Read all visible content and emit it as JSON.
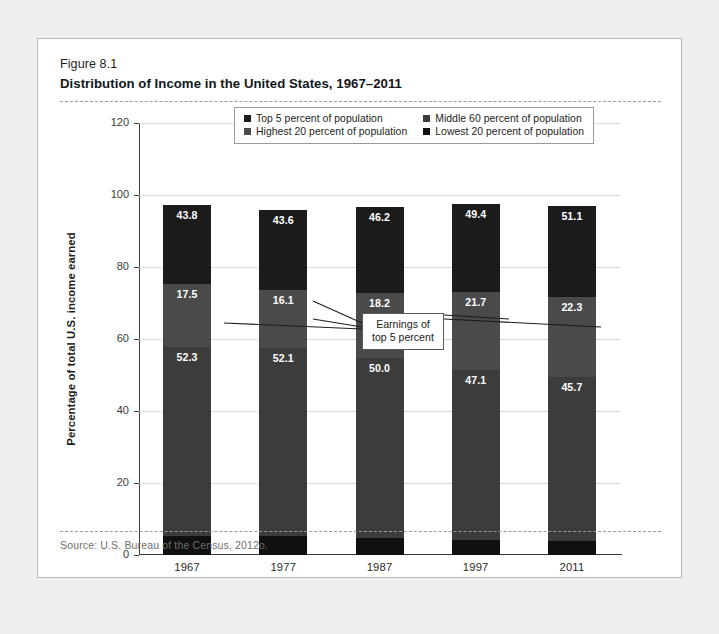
{
  "figure": {
    "number": "Figure 8.1",
    "title": "Distribution of Income in the United States, 1967–2011",
    "source": "Source: U.S. Bureau of the Census, 2012o."
  },
  "callout": {
    "line1": "Earnings of",
    "line2": "top 5 percent"
  },
  "legend": {
    "items": [
      {
        "label": "Top 5 percent of population",
        "color": "#1b1b1b"
      },
      {
        "label": "Middle 60 percent of population",
        "color": "#3c3c3c"
      },
      {
        "label": "Highest 20 percent of population",
        "color": "#4a4a4a"
      },
      {
        "label": "Lowest 20 percent of population",
        "color": "#101010"
      }
    ]
  },
  "chart_data": {
    "type": "bar",
    "title": "Distribution of Income in the United States, 1967–2011",
    "xlabel": "",
    "ylabel": "Percentage of total U.S. income earned",
    "ylim": [
      0,
      120
    ],
    "yticks": [
      0,
      20,
      40,
      60,
      80,
      100,
      120
    ],
    "ytick_labels": [
      "0",
      "20",
      "40",
      "60",
      "80",
      "100",
      "120"
    ],
    "grid": true,
    "stacked": true,
    "legend_position": "top-center",
    "categories": [
      "1967",
      "1977",
      "1987",
      "1997",
      "2011"
    ],
    "series": [
      {
        "name": "Lowest 20 percent of population",
        "color": "#101010",
        "values": [
          5.4,
          5.4,
          4.6,
          4.2,
          3.8
        ],
        "labels": [
          "",
          "",
          "",
          "",
          ""
        ]
      },
      {
        "name": "Middle 60 percent of population",
        "color": "#3c3c3c",
        "values": [
          52.3,
          52.1,
          50.0,
          47.1,
          45.7
        ],
        "labels": [
          "52.3",
          "52.1",
          "50.0",
          "47.1",
          "45.7"
        ]
      },
      {
        "name": "Highest 20 percent of population",
        "color": "#4a4a4a",
        "values": [
          17.5,
          16.1,
          18.2,
          21.7,
          22.3
        ],
        "labels": [
          "17.5",
          "16.1",
          "18.2",
          "21.7",
          "22.3"
        ]
      },
      {
        "name": "Top 5 percent of population",
        "color": "#1b1b1b",
        "values": [
          22.0,
          22.2,
          23.8,
          24.5,
          25.2
        ],
        "labels": [
          "43.8",
          "43.6",
          "46.2",
          "49.4",
          "51.1"
        ]
      }
    ]
  }
}
